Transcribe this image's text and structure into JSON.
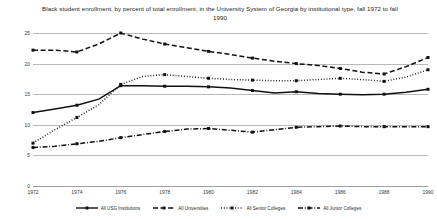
{
  "chart_data": {
    "type": "line",
    "title": "Black student enrollment, by percent of total enrollment, in the University System of Georgia by institutional type, fall 1972 to fall 1990",
    "xlabel": "",
    "ylabel": "",
    "ylim": [
      0,
      25
    ],
    "yticks": [
      0,
      5,
      10,
      15,
      20,
      25
    ],
    "grid": true,
    "legend_position": "bottom",
    "x": [
      1972,
      1973,
      1974,
      1975,
      1976,
      1977,
      1978,
      1979,
      1980,
      1981,
      1982,
      1983,
      1984,
      1985,
      1986,
      1987,
      1988,
      1989,
      1990
    ],
    "xtick_labels": [
      "1972",
      "1974",
      "1976",
      "1978",
      "1980",
      "1982",
      "1984",
      "1986",
      "1988",
      "1990"
    ],
    "xticks": [
      1972,
      1974,
      1976,
      1978,
      1980,
      1982,
      1984,
      1986,
      1988,
      1990
    ],
    "series": [
      {
        "name": "All USG Institutions",
        "style": "solid",
        "color": "#111111",
        "values": [
          12.0,
          12.6,
          13.2,
          14.2,
          16.4,
          16.4,
          16.3,
          16.3,
          16.2,
          16.0,
          15.6,
          15.2,
          15.4,
          15.1,
          15.0,
          14.9,
          15.0,
          15.3,
          15.8
        ]
      },
      {
        "name": "All Universities",
        "style": "dashed",
        "color": "#111111",
        "values": [
          22.2,
          22.2,
          21.9,
          23.2,
          25.0,
          24.0,
          23.2,
          22.6,
          22.0,
          21.5,
          20.9,
          20.4,
          20.0,
          19.7,
          19.2,
          18.6,
          18.3,
          19.5,
          21.0
        ]
      },
      {
        "name": "All Senior Colleges",
        "style": "dotted",
        "color": "#111111",
        "values": [
          7.0,
          9.2,
          11.2,
          13.3,
          16.6,
          17.9,
          18.2,
          17.9,
          17.6,
          17.4,
          17.3,
          17.2,
          17.2,
          17.4,
          17.6,
          17.4,
          17.1,
          17.8,
          19.0
        ]
      },
      {
        "name": "All Junior Colleges",
        "style": "dashdot",
        "color": "#111111",
        "values": [
          6.3,
          6.5,
          6.9,
          7.3,
          7.9,
          8.4,
          8.9,
          9.3,
          9.4,
          9.1,
          8.8,
          9.2,
          9.6,
          9.7,
          9.8,
          9.7,
          9.7,
          9.7,
          9.7
        ]
      }
    ]
  }
}
